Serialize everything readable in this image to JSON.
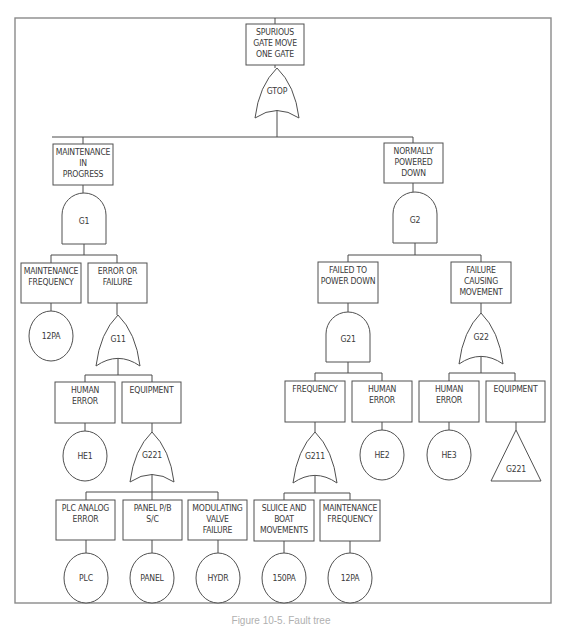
{
  "diagram": {
    "type": "fault-tree",
    "frame": {
      "x": 15,
      "y": 18,
      "w": 536,
      "h": 585
    },
    "caption": "Figure 10-5. Fault tree",
    "events": [
      {
        "id": "top",
        "lines": [
          "SPURIOUS",
          "GATE MOVE",
          "ONE GATE"
        ],
        "x": 246,
        "y": 24,
        "w": 58,
        "h": 41
      },
      {
        "id": "maint-in-progress",
        "lines": [
          "MAINTENANCE",
          "IN",
          "PROGRESS"
        ],
        "x": 53,
        "y": 144,
        "w": 60,
        "h": 41
      },
      {
        "id": "normally-powered-down",
        "lines": [
          "NORMALLY",
          "POWERED",
          "DOWN"
        ],
        "x": 384,
        "y": 143,
        "w": 59,
        "h": 40
      },
      {
        "id": "maint-frequency-1",
        "lines": [
          "MAINTENANCE",
          "FREQUENCY"
        ],
        "x": 21,
        "y": 263,
        "w": 60,
        "h": 40
      },
      {
        "id": "error-or-failure",
        "lines": [
          "ERROR OR",
          "FAILURE"
        ],
        "x": 88,
        "y": 263,
        "w": 59,
        "h": 40
      },
      {
        "id": "failed-to-power-down",
        "lines": [
          "FAILED TO",
          "POWER DOWN"
        ],
        "x": 318,
        "y": 262,
        "w": 60,
        "h": 41
      },
      {
        "id": "failure-causing-movement",
        "lines": [
          "FAILURE",
          "CAUSING",
          "MOVEMENT"
        ],
        "x": 451,
        "y": 262,
        "w": 60,
        "h": 41
      },
      {
        "id": "human-error-1",
        "lines": [
          "HUMAN",
          "ERROR"
        ],
        "x": 55,
        "y": 382,
        "w": 60,
        "h": 41
      },
      {
        "id": "equipment-1",
        "lines": [
          "EQUIPMENT"
        ],
        "x": 122,
        "y": 382,
        "w": 59,
        "h": 41
      },
      {
        "id": "frequency",
        "lines": [
          "FREQUENCY"
        ],
        "x": 285,
        "y": 381,
        "w": 60,
        "h": 41
      },
      {
        "id": "human-error-2",
        "lines": [
          "HUMAN",
          "ERROR"
        ],
        "x": 352,
        "y": 381,
        "w": 60,
        "h": 41
      },
      {
        "id": "human-error-3",
        "lines": [
          "HUMAN",
          "ERROR"
        ],
        "x": 419,
        "y": 381,
        "w": 60,
        "h": 41
      },
      {
        "id": "equipment-2",
        "lines": [
          "EQUIPMENT"
        ],
        "x": 486,
        "y": 381,
        "w": 59,
        "h": 41
      },
      {
        "id": "plc-analog-error",
        "lines": [
          "PLC ANALOG",
          "ERROR"
        ],
        "x": 56,
        "y": 500,
        "w": 59,
        "h": 40
      },
      {
        "id": "panel-pb-sc",
        "lines": [
          "PANEL P/B",
          "S/C"
        ],
        "x": 123,
        "y": 500,
        "w": 59,
        "h": 40
      },
      {
        "id": "modulating-valve-failure",
        "lines": [
          "MODULATING",
          "VALVE",
          "FAILURE"
        ],
        "x": 188,
        "y": 500,
        "w": 59,
        "h": 40
      },
      {
        "id": "sluice-boat-movements",
        "lines": [
          "SLUICE AND",
          "BOAT",
          "MOVEMENTS"
        ],
        "x": 254,
        "y": 500,
        "w": 60,
        "h": 41
      },
      {
        "id": "maint-frequency-2",
        "lines": [
          "MAINTENANCE",
          "FREQUENCY"
        ],
        "x": 320,
        "y": 500,
        "w": 60,
        "h": 41
      }
    ],
    "gates": [
      {
        "id": "GTOP",
        "label": "GTOP",
        "kind": "or",
        "cx": 277,
        "y": 68,
        "w": 44,
        "h": 50
      },
      {
        "id": "G1",
        "label": "G1",
        "kind": "and",
        "cx": 84,
        "y": 193,
        "w": 44,
        "h": 51
      },
      {
        "id": "G2",
        "label": "G2",
        "kind": "and",
        "cx": 415,
        "y": 192,
        "w": 44,
        "h": 51
      },
      {
        "id": "G11",
        "label": "G11",
        "kind": "or",
        "cx": 118,
        "y": 315,
        "w": 44,
        "h": 51
      },
      {
        "id": "G21",
        "label": "G21",
        "kind": "and",
        "cx": 348,
        "y": 312,
        "w": 44,
        "h": 50
      },
      {
        "id": "G22",
        "label": "G22",
        "kind": "or",
        "cx": 481,
        "y": 313,
        "w": 44,
        "h": 51
      },
      {
        "id": "G221",
        "label": "G221",
        "kind": "or",
        "cx": 152,
        "y": 432,
        "w": 44,
        "h": 50
      },
      {
        "id": "G211",
        "label": "G211",
        "kind": "or",
        "cx": 315,
        "y": 432,
        "w": 44,
        "h": 51
      }
    ],
    "basic_events": [
      {
        "id": "12PA-a",
        "label": "12PA",
        "cx": 51,
        "cy": 336,
        "rx": 22,
        "ry": 25
      },
      {
        "id": "HE1",
        "label": "HE1",
        "cx": 85,
        "cy": 456,
        "rx": 22,
        "ry": 25
      },
      {
        "id": "HE2",
        "label": "HE2",
        "cx": 382,
        "cy": 455,
        "rx": 22,
        "ry": 25
      },
      {
        "id": "HE3",
        "label": "HE3",
        "cx": 449,
        "cy": 455,
        "rx": 22,
        "ry": 25
      },
      {
        "id": "PLC",
        "label": "PLC",
        "cx": 86,
        "cy": 578,
        "rx": 22,
        "ry": 25
      },
      {
        "id": "PANEL",
        "label": "PANEL",
        "cx": 152,
        "cy": 578,
        "rx": 22,
        "ry": 25
      },
      {
        "id": "HYDR",
        "label": "HYDR",
        "cx": 218,
        "cy": 578,
        "rx": 22,
        "ry": 25
      },
      {
        "id": "150PA",
        "label": "150PA",
        "cx": 284,
        "cy": 578,
        "rx": 22,
        "ry": 25
      },
      {
        "id": "12PA-b",
        "label": "12PA",
        "cx": 350,
        "cy": 578,
        "rx": 22,
        "ry": 25
      }
    ],
    "transfers": [
      {
        "id": "G221-transfer",
        "label": "G221",
        "cx": 516,
        "top": 430,
        "base": 481,
        "half": 25
      }
    ],
    "connectors": [
      [
        275,
        18,
        275,
        24
      ],
      [
        275,
        65,
        275,
        68
      ],
      [
        277,
        100,
        277,
        137
      ],
      [
        52,
        137,
        413,
        137
      ],
      [
        83,
        137,
        83,
        144
      ],
      [
        413,
        137,
        413,
        143
      ],
      [
        83,
        185,
        83,
        193
      ],
      [
        84,
        244,
        84,
        255
      ],
      [
        51,
        255,
        117,
        255
      ],
      [
        51,
        255,
        51,
        263
      ],
      [
        117,
        255,
        117,
        263
      ],
      [
        51,
        303,
        51,
        311
      ],
      [
        117,
        303,
        117,
        315
      ],
      [
        118,
        348,
        118,
        375
      ],
      [
        85,
        375,
        152,
        375
      ],
      [
        85,
        375,
        85,
        382
      ],
      [
        152,
        375,
        152,
        382
      ],
      [
        85,
        423,
        85,
        431
      ],
      [
        152,
        423,
        152,
        432
      ],
      [
        152,
        464,
        152,
        492
      ],
      [
        86,
        492,
        218,
        492
      ],
      [
        86,
        492,
        86,
        500
      ],
      [
        152,
        492,
        152,
        500
      ],
      [
        218,
        492,
        218,
        500
      ],
      [
        86,
        540,
        86,
        553
      ],
      [
        152,
        540,
        152,
        553
      ],
      [
        218,
        540,
        218,
        553
      ],
      [
        413,
        183,
        413,
        192
      ],
      [
        415,
        243,
        415,
        255
      ],
      [
        348,
        255,
        481,
        255
      ],
      [
        348,
        255,
        348,
        262
      ],
      [
        481,
        255,
        481,
        262
      ],
      [
        348,
        303,
        348,
        312
      ],
      [
        481,
        303,
        481,
        313
      ],
      [
        348,
        362,
        348,
        373
      ],
      [
        315,
        373,
        382,
        373
      ],
      [
        315,
        373,
        315,
        381
      ],
      [
        382,
        373,
        382,
        381
      ],
      [
        315,
        422,
        315,
        432
      ],
      [
        382,
        422,
        382,
        430
      ],
      [
        315,
        465,
        315,
        493
      ],
      [
        284,
        493,
        350,
        493
      ],
      [
        284,
        493,
        284,
        500
      ],
      [
        350,
        493,
        350,
        500
      ],
      [
        284,
        541,
        284,
        553
      ],
      [
        350,
        541,
        350,
        553
      ],
      [
        481,
        346,
        481,
        373
      ],
      [
        449,
        373,
        515,
        373
      ],
      [
        449,
        373,
        449,
        381
      ],
      [
        515,
        373,
        515,
        381
      ],
      [
        449,
        422,
        449,
        430
      ],
      [
        516,
        422,
        516,
        430
      ]
    ]
  }
}
